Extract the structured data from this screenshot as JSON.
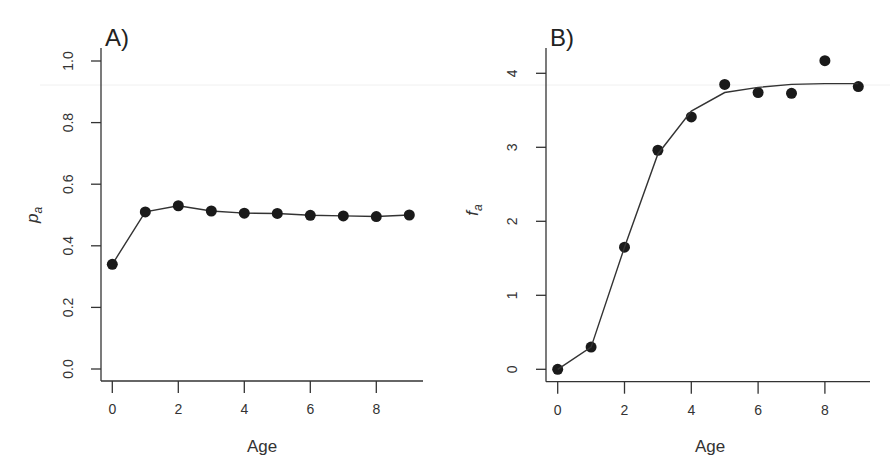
{
  "chart_data": [
    {
      "panel": "A)",
      "type": "line",
      "xlabel": "Age",
      "ylabel": "p_a",
      "ylabel_main": "p",
      "ylabel_sub": "a",
      "xlim": [
        0,
        9
      ],
      "ylim": [
        0.0,
        1.0
      ],
      "xticks": [
        0,
        2,
        4,
        6,
        8
      ],
      "yticks": [
        "0.0",
        "0.2",
        "0.4",
        "0.6",
        "0.8",
        "1.0"
      ],
      "grid": false,
      "x": [
        0,
        1,
        2,
        3,
        4,
        5,
        6,
        7,
        8,
        9
      ],
      "series": [
        {
          "name": "p_a",
          "style": "line+points",
          "values": [
            0.34,
            0.51,
            0.53,
            0.513,
            0.506,
            0.505,
            0.499,
            0.497,
            0.495,
            0.5
          ]
        }
      ]
    },
    {
      "panel": "B)",
      "type": "line",
      "xlabel": "Age",
      "ylabel": "f_a",
      "ylabel_main": "f",
      "ylabel_sub": "a",
      "xlim": [
        0,
        9
      ],
      "ylim": [
        0,
        4
      ],
      "xticks": [
        0,
        2,
        4,
        6,
        8
      ],
      "yticks": [
        "0",
        "1",
        "2",
        "3",
        "4"
      ],
      "grid": false,
      "x": [
        0,
        1,
        2,
        3,
        4,
        5,
        6,
        7,
        8,
        9
      ],
      "series": [
        {
          "name": "observed",
          "style": "points",
          "values": [
            0.0,
            0.3,
            1.65,
            2.96,
            3.41,
            3.85,
            3.74,
            3.73,
            4.17,
            3.82
          ]
        },
        {
          "name": "fitted",
          "style": "line",
          "values": [
            0.0,
            0.3,
            1.65,
            2.91,
            3.49,
            3.74,
            3.81,
            3.85,
            3.86,
            3.86
          ]
        }
      ]
    }
  ]
}
